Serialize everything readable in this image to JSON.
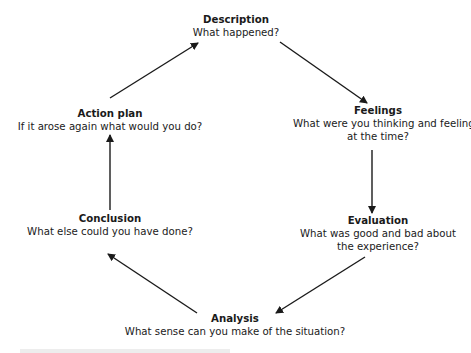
{
  "diagram": {
    "type": "cycle",
    "nodes": [
      {
        "id": "description",
        "title": "Description",
        "lines": [
          "What happened?"
        ]
      },
      {
        "id": "feelings",
        "title": "Feelings",
        "lines": [
          "What were you thinking and feeling",
          "at the time?"
        ]
      },
      {
        "id": "evaluation",
        "title": "Evaluation",
        "lines": [
          "What was good and bad about",
          "the experience?"
        ]
      },
      {
        "id": "analysis",
        "title": "Analysis",
        "lines": [
          "What sense can you make of the situation?"
        ]
      },
      {
        "id": "conclusion",
        "title": "Conclusion",
        "lines": [
          "What else could you have done?"
        ]
      },
      {
        "id": "action_plan",
        "title": "Action plan",
        "lines": [
          "If it arose again what would you do?"
        ]
      }
    ],
    "edges": [
      {
        "from": "description",
        "to": "feelings"
      },
      {
        "from": "feelings",
        "to": "evaluation"
      },
      {
        "from": "evaluation",
        "to": "analysis"
      },
      {
        "from": "analysis",
        "to": "conclusion"
      },
      {
        "from": "conclusion",
        "to": "action_plan"
      },
      {
        "from": "action_plan",
        "to": "description"
      }
    ],
    "colors": {
      "text": "#1a1a1a",
      "arrow": "#1a1a1a",
      "background": "#ffffff"
    }
  }
}
